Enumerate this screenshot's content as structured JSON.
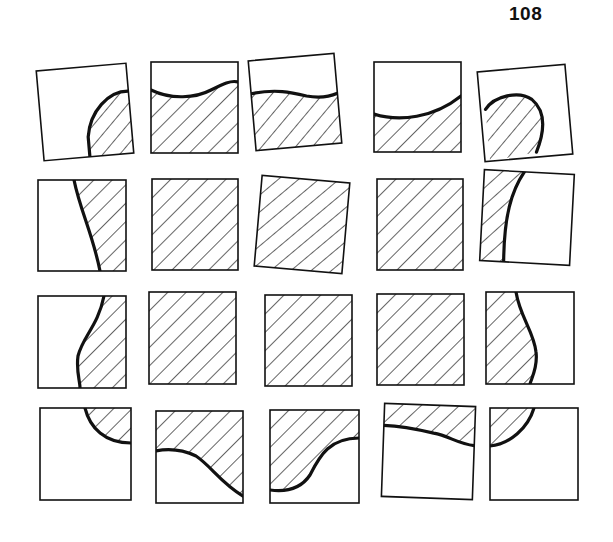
{
  "page": {
    "number": "108"
  },
  "puzzle": {
    "description": "Jigsaw grid of 20 square tiles, 4 rows x 5 columns, some rotated; hatched region forms a shape",
    "hatch_color": "#111111",
    "line_color": "#111111",
    "tiles": [
      {
        "id": "r1c1",
        "x": 40,
        "y": 67,
        "w": 90,
        "h": 90,
        "rot": -5,
        "fill": "M90,28 C70,26 50,45 46,70 L46,90 L90,90 Z",
        "curve": "M90,28 C70,26 50,45 46,70 L46,90"
      },
      {
        "id": "r1c2",
        "x": 151,
        "y": 62,
        "w": 87,
        "h": 91,
        "rot": 0,
        "fill": "M0,28 C20,38 45,36 60,28 C72,22 80,18 87,20 L87,91 L0,91 Z",
        "curve": "M0,28 C20,38 45,36 60,28 C72,22 80,18 87,20"
      },
      {
        "id": "r1c3",
        "x": 252,
        "y": 57,
        "w": 86,
        "h": 90,
        "rot": -5,
        "fill": "M0,33 C25,30 40,35 55,40 C70,44 80,42 86,40 L86,90 L0,90 Z",
        "curve": "M0,33 C25,30 40,35 55,40 C70,44 80,42 86,40"
      },
      {
        "id": "r1c4",
        "x": 374,
        "y": 62,
        "w": 87,
        "h": 90,
        "rot": 0,
        "fill": "M0,52 C25,60 60,56 87,34 L87,90 L0,90 Z",
        "curve": "M0,52 C25,60 60,56 87,34"
      },
      {
        "id": "r1c5",
        "x": 481,
        "y": 68,
        "w": 88,
        "h": 90,
        "rot": -5,
        "fill": "M5,38 C15,25 40,22 52,32 C65,45 62,65 52,85 L5,90 Z",
        "curve": "M5,38 C15,25 40,22 52,32 C65,45 62,65 52,85"
      },
      {
        "id": "r2c1",
        "x": 38,
        "y": 180,
        "w": 88,
        "h": 91,
        "rot": 0,
        "fill": "M36,0 C42,30 55,55 62,91 L88,91 L88,0 Z",
        "curve": "M36,0 C42,30 55,55 62,91"
      },
      {
        "id": "r2c2",
        "x": 152,
        "y": 179,
        "w": 86,
        "h": 91,
        "rot": 0,
        "fill": "M0,0 L86,0 L86,91 L0,91 Z",
        "curve": ""
      },
      {
        "id": "r2c3",
        "x": 258,
        "y": 179,
        "w": 88,
        "h": 91,
        "rot": 5,
        "fill": "M0,0 L88,0 L88,91 L0,91 Z",
        "curve": ""
      },
      {
        "id": "r2c4",
        "x": 377,
        "y": 179,
        "w": 86,
        "h": 91,
        "rot": 0,
        "fill": "M0,0 L86,0 L86,91 L0,91 Z",
        "curve": ""
      },
      {
        "id": "r2c5",
        "x": 482,
        "y": 172,
        "w": 90,
        "h": 91,
        "rot": 3,
        "fill": "M0,0 L40,0 C28,20 22,45 24,91 L0,91 Z",
        "curve": "M40,0 C28,20 22,45 24,91"
      },
      {
        "id": "r3c1",
        "x": 38,
        "y": 296,
        "w": 88,
        "h": 92,
        "rot": 0,
        "fill": "M66,0 C60,30 45,40 40,60 C38,75 42,85 42,92 L88,92 L88,0 Z",
        "curve": "M66,0 C60,30 45,40 40,60 C38,75 42,85 42,92"
      },
      {
        "id": "r3c2",
        "x": 149,
        "y": 292,
        "w": 87,
        "h": 92,
        "rot": 0,
        "fill": "M0,0 L87,0 L87,92 L0,92 Z",
        "curve": ""
      },
      {
        "id": "r3c3",
        "x": 265,
        "y": 295,
        "w": 87,
        "h": 91,
        "rot": 0,
        "fill": "M0,0 L87,0 L87,91 L0,91 Z",
        "curve": ""
      },
      {
        "id": "r3c4",
        "x": 377,
        "y": 294,
        "w": 87,
        "h": 91,
        "rot": 0,
        "fill": "M0,0 L87,0 L87,91 L0,91 Z",
        "curve": ""
      },
      {
        "id": "r3c5",
        "x": 486,
        "y": 292,
        "w": 88,
        "h": 92,
        "rot": 0,
        "fill": "M0,0 L30,0 C34,25 48,40 50,60 C52,75 46,85 44,92 L0,92 Z",
        "curve": "M30,0 C34,25 48,40 50,60 C52,75 46,85 44,92"
      },
      {
        "id": "r4c1",
        "x": 40,
        "y": 408,
        "w": 91,
        "h": 92,
        "rot": 0,
        "fill": "M45,0 C50,20 65,35 91,35 L91,0 Z",
        "curve": "M45,0 C50,20 65,35 91,35"
      },
      {
        "id": "r4c2",
        "x": 156,
        "y": 411,
        "w": 87,
        "h": 92,
        "rot": 0,
        "fill": "M0,0 L87,0 L87,85 C65,72 55,55 40,45 C25,38 10,38 0,40 Z",
        "curve": "M0,40 C10,38 25,38 40,45 C55,55 65,72 87,85"
      },
      {
        "id": "r4c3",
        "x": 270,
        "y": 410,
        "w": 89,
        "h": 93,
        "rot": 0,
        "fill": "M0,0 L89,0 L89,28 C60,28 50,45 40,65 C30,80 15,82 0,80 Z",
        "curve": "M89,28 C60,28 50,45 40,65 C30,80 15,82 0,80"
      },
      {
        "id": "r4c4",
        "x": 383,
        "y": 405,
        "w": 91,
        "h": 93,
        "rot": 2,
        "fill": "M0,0 L91,0 L91,39 C75,38 65,30 50,28 C30,24 15,22 0,22 Z",
        "curve": "M0,22 C15,22 30,24 50,28 C65,30 75,38 91,39"
      },
      {
        "id": "r4c5",
        "x": 490,
        "y": 408,
        "w": 88,
        "h": 92,
        "rot": 0,
        "fill": "M0,0 L44,0 C38,20 20,36 0,38 Z",
        "curve": "M44,0 C38,20 20,36 0,38"
      }
    ]
  }
}
